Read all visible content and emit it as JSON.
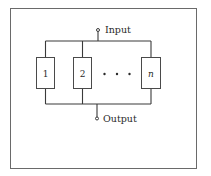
{
  "diagram": {
    "type": "parallel-system-block-diagram",
    "input_label": "Input",
    "output_label": "Output",
    "components": [
      {
        "label": "1"
      },
      {
        "label": "2"
      },
      {
        "label": "n"
      }
    ],
    "ellipsis": "• • •",
    "colors": {
      "line": "#3a3a3a",
      "frame": "#6a6a6a",
      "background": "#ffffff"
    }
  }
}
